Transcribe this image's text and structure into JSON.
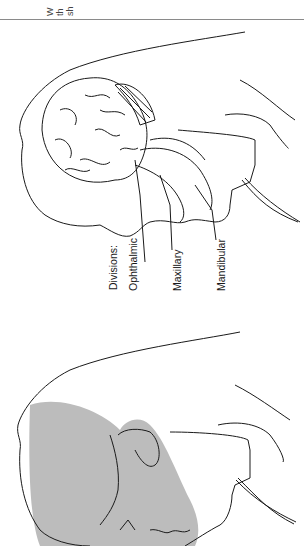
{
  "header": {
    "text_fragments": [
      "W",
      "th",
      "sh"
    ]
  },
  "figure": {
    "labels": {
      "divisions": "Divisions:",
      "ophthalmic": "Ophthalmic",
      "maxillary": "Maxillary",
      "mandibular": "Mandibular"
    },
    "colors": {
      "line": "#1a1a1a",
      "shading": "#bcbcbc",
      "rule": "#8a8a8a"
    }
  }
}
